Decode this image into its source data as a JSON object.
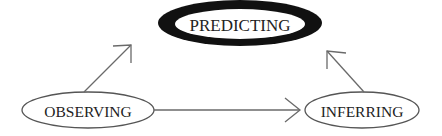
{
  "diagram": {
    "nodes": [
      {
        "id": "predicting",
        "label": "PREDICTING",
        "style": "bold-black-ring"
      },
      {
        "id": "observing",
        "label": "OBSERVING",
        "style": "thin-outline"
      },
      {
        "id": "inferring",
        "label": "INFERRING",
        "style": "thin-outline"
      }
    ],
    "edges": [
      {
        "from": "observing",
        "to": "predicting"
      },
      {
        "from": "observing",
        "to": "inferring"
      },
      {
        "from": "inferring",
        "to": "predicting"
      }
    ],
    "colors": {
      "ring": "#111111",
      "outline": "#555555",
      "arrow": "#6a6a6a",
      "text": "#222222",
      "background": "#ffffff"
    }
  }
}
